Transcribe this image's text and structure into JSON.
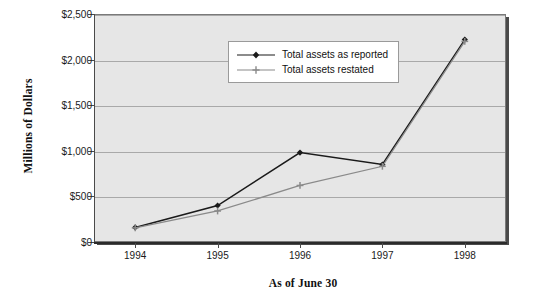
{
  "chart_data": {
    "type": "line",
    "title": "",
    "xlabel": "As of June 30",
    "ylabel": "Millions of Dollars",
    "categories": [
      "1994",
      "1995",
      "1996",
      "1997",
      "1998"
    ],
    "ylim": [
      0,
      2500
    ],
    "ytick_labels": [
      "$0",
      "$500",
      "$1,000",
      "$1,500",
      "$2,000",
      "$2,500"
    ],
    "ytick_values": [
      0,
      500,
      1000,
      1500,
      2000,
      2500
    ],
    "grid": true,
    "legend_position": "top-center",
    "series": [
      {
        "name": "Total assets as reported",
        "values": [
          160,
          400,
          980,
          850,
          2220
        ],
        "color": "#1a1a1a",
        "marker": "diamond"
      },
      {
        "name": "Total assets restated",
        "values": [
          155,
          340,
          620,
          830,
          2200
        ],
        "color": "#8a8a8a",
        "marker": "plus"
      }
    ]
  },
  "legend": {
    "items": [
      {
        "label": "Total assets as reported"
      },
      {
        "label": "Total assets restated"
      }
    ]
  },
  "colors": {
    "plot_background": "#e6e6e6",
    "gridline": "#a9a9a9",
    "axis": "#2b2b2b",
    "series_reported": "#1a1a1a",
    "series_restated": "#8a8a8a"
  }
}
